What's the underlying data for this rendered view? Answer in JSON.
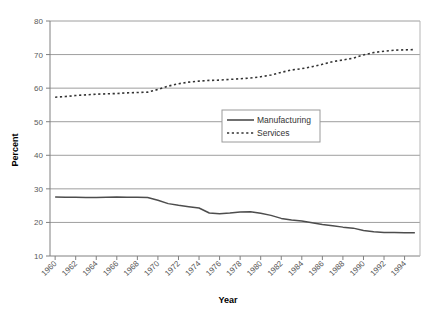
{
  "chart_data": {
    "type": "line",
    "title": "",
    "xlabel": "Year",
    "ylabel": "Percent",
    "xlim": [
      1959.5,
      1995.5
    ],
    "ylim": [
      10,
      80
    ],
    "ytick_step": 10,
    "xtick_step": 2,
    "grid": "horizontal",
    "legend_position": "center",
    "yticks": [
      "10",
      "20",
      "30",
      "40",
      "50",
      "60",
      "70",
      "80"
    ],
    "xticks": [
      "1960",
      "1962",
      "1964",
      "1966",
      "1968",
      "1970",
      "1972",
      "1974",
      "1976",
      "1978",
      "1980",
      "1982",
      "1984",
      "1986",
      "1988",
      "1990",
      "1992",
      "1994"
    ],
    "x": [
      1960,
      1961,
      1962,
      1963,
      1964,
      1965,
      1966,
      1967,
      1968,
      1969,
      1970,
      1971,
      1972,
      1973,
      1974,
      1975,
      1976,
      1977,
      1978,
      1979,
      1980,
      1981,
      1982,
      1983,
      1984,
      1985,
      1986,
      1987,
      1988,
      1989,
      1990,
      1991,
      1992,
      1993,
      1994,
      1995
    ],
    "series": [
      {
        "name": "Manufacturing",
        "style": "solid",
        "color": "#4d4d4d",
        "values": [
          27.6,
          27.5,
          27.5,
          27.4,
          27.4,
          27.5,
          27.6,
          27.5,
          27.5,
          27.4,
          26.6,
          25.6,
          25.1,
          24.7,
          24.3,
          22.8,
          22.6,
          22.8,
          23.1,
          23.2,
          22.7,
          22.1,
          21.2,
          20.7,
          20.4,
          19.9,
          19.4,
          19.0,
          18.6,
          18.3,
          17.6,
          17.2,
          17.0,
          17.0,
          16.9,
          16.9
        ]
      },
      {
        "name": "Services",
        "style": "dotted",
        "color": "#333333",
        "values": [
          57.3,
          57.5,
          57.8,
          58.0,
          58.2,
          58.3,
          58.4,
          58.6,
          58.7,
          58.8,
          59.6,
          60.6,
          61.3,
          61.8,
          62.1,
          62.3,
          62.4,
          62.6,
          62.8,
          63.0,
          63.4,
          63.9,
          64.7,
          65.4,
          65.8,
          66.4,
          67.1,
          67.9,
          68.4,
          68.9,
          69.9,
          70.6,
          71.0,
          71.3,
          71.4,
          71.5
        ]
      }
    ]
  },
  "legend": {
    "items": [
      {
        "label": "Manufacturing",
        "style": "solid"
      },
      {
        "label": "Services",
        "style": "dotted"
      }
    ]
  },
  "axes": {
    "y_title": "Percent",
    "x_title": "Year"
  }
}
